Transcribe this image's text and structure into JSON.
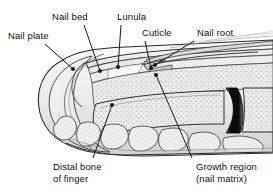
{
  "figure": {
    "background_color": "#ffffff",
    "line_color": "#1a1a1a",
    "tissue_fill": "#ededed",
    "bone_fill": "#e4e4e4",
    "joint_color": "#000000",
    "shade_light": "#f4f4f4",
    "shade_mid": "#d8d8d8",
    "shade_dark": "#9a9a9a"
  },
  "labels": [
    {
      "id": "nail-plate",
      "text": "Nail plate",
      "lines": [
        "Nail plate"
      ],
      "x": 8,
      "y": 30,
      "leader": {
        "x1": 45,
        "y1": 44,
        "x2": 73,
        "y2": 69,
        "dot_x": 73,
        "dot_y": 69
      }
    },
    {
      "id": "nail-bed",
      "text": "Nail bed",
      "lines": [
        "Nail bed"
      ],
      "x": 52,
      "y": 11,
      "leader": {
        "x1": 84,
        "y1": 25,
        "x2": 100,
        "y2": 71,
        "dot_x": 100,
        "dot_y": 71
      }
    },
    {
      "id": "lunula",
      "text": "Lunula",
      "lines": [
        "Lunula"
      ],
      "x": 117,
      "y": 11,
      "leader": {
        "x1": 121,
        "y1": 25,
        "x2": 118,
        "y2": 67,
        "dot_x": 118,
        "dot_y": 67
      }
    },
    {
      "id": "cuticle",
      "text": "Cuticle",
      "lines": [
        "Cuticle"
      ],
      "x": 142,
      "y": 27,
      "leader": {
        "x1": 145,
        "y1": 41,
        "x2": 151,
        "y2": 68,
        "dot_x": 151,
        "dot_y": 68
      }
    },
    {
      "id": "nail-root",
      "text": "Nail root",
      "lines": [
        "Nail root"
      ],
      "x": 197,
      "y": 27,
      "leader": {
        "x1": 194,
        "y1": 41,
        "x2": 155,
        "y2": 65,
        "dot_x": 155,
        "dot_y": 65
      }
    },
    {
      "id": "distal-bone-of-finger",
      "text": "Distal bone of finger",
      "lines": [
        "Distal bone",
        "of finger"
      ],
      "x": 53,
      "y": 161,
      "leader": {
        "x1": 93,
        "y1": 158,
        "x2": 112,
        "y2": 105,
        "dot_x": 112,
        "dot_y": 105
      }
    },
    {
      "id": "growth-region-nail-matrix",
      "text": "Growth region (nail matrix)",
      "lines": [
        "Growth region",
        "(nail matrix)"
      ],
      "x": 196,
      "y": 161,
      "leader": {
        "x1": 192,
        "y1": 158,
        "x2": 156,
        "y2": 75,
        "dot_x": 156,
        "dot_y": 75
      }
    }
  ]
}
